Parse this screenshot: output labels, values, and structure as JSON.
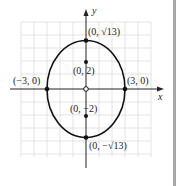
{
  "diagram": {
    "type": "ellipse-graph",
    "equation_shown": false,
    "axes": {
      "x_label": "x",
      "y_label": "y"
    },
    "grid": {
      "cols": 10,
      "rows": 10,
      "color": "#dcdcdc"
    },
    "colors": {
      "curve": "#111111",
      "axis": "#222222",
      "point": "#111111"
    },
    "points": [
      {
        "id": "top-vertex",
        "label": "(0, √13)",
        "x": 0,
        "y": 3.606,
        "style": "filled"
      },
      {
        "id": "bottom-vertex",
        "label": "(0, −√13)",
        "x": 0,
        "y": -3.606,
        "style": "filled"
      },
      {
        "id": "left-vertex",
        "label": "(−3, 0)",
        "x": -3,
        "y": 0,
        "style": "filled"
      },
      {
        "id": "right-vertex",
        "label": "(3, 0)",
        "x": 3,
        "y": 0,
        "style": "filled"
      },
      {
        "id": "focus-top",
        "label": "(0, 2)",
        "x": 0,
        "y": 2,
        "style": "filled"
      },
      {
        "id": "focus-bottom",
        "label": "(0, −2)",
        "x": 0,
        "y": -2,
        "style": "filled"
      },
      {
        "id": "center",
        "label": "",
        "x": 0,
        "y": 0,
        "style": "open"
      }
    ]
  }
}
